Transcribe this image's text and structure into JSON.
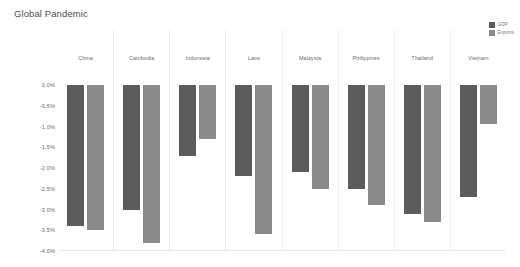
{
  "chart": {
    "title": "Global Pandemic"
  },
  "legend": {
    "position": "top-right",
    "items": [
      {
        "label": "GDP",
        "color": "#5c5c5c",
        "key": "gdp"
      },
      {
        "label": "Exports",
        "color": "#8a8a8a",
        "key": "exports"
      }
    ]
  },
  "chart_data": {
    "type": "bar",
    "title": "Global Pandemic",
    "xlabel": "",
    "ylabel": "",
    "ylim": [
      -4.0,
      0.0
    ],
    "unit": "%",
    "grid": false,
    "orientation": "vertical",
    "facet": "country",
    "legend_position": "top-right",
    "ticks": [
      "0.0%",
      "-0.5%",
      "-1.0%",
      "-1.5%",
      "-2.0%",
      "-2.5%",
      "-3.0%",
      "-3.5%",
      "-4.0%"
    ],
    "tick_values": [
      0.0,
      -0.5,
      -1.0,
      -1.5,
      -2.0,
      -2.5,
      -3.0,
      -3.5,
      -4.0
    ],
    "categories": [
      "China",
      "Cambodia",
      "Indonesia",
      "Laos",
      "Malaysia",
      "Philippines",
      "Thailand",
      "Vietnam"
    ],
    "series": [
      {
        "name": "GDP",
        "color": "#5c5c5c",
        "values": [
          -3.4,
          -3.0,
          -1.7,
          -2.2,
          -2.1,
          -2.5,
          -3.1,
          -2.7
        ]
      },
      {
        "name": "Exports",
        "color": "#8a8a8a",
        "values": [
          -3.5,
          -3.8,
          -1.3,
          -3.6,
          -2.5,
          -2.9,
          -3.3,
          -0.95
        ]
      }
    ]
  }
}
